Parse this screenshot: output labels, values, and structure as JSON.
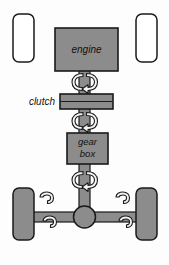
{
  "diagram": {
    "type": "mechanical-schematic",
    "background_color": "#fdfdfd",
    "palette": {
      "component_fill": "#8c8c8c",
      "shaft_fill": "#8c8c8c",
      "outline": "#1a1a1a",
      "wheel_front_fill": "#ffffff",
      "wheel_rear_fill": "#8c8c8c",
      "rotation_symbol_fill": "#f2f2f2",
      "text_color": "#111111"
    },
    "components": {
      "engine": {
        "label": "engine",
        "shape": "rectangle",
        "fill": "#8c8c8c",
        "x": 55,
        "y": 28,
        "width": 63,
        "height": 43
      },
      "clutch": {
        "label": "clutch",
        "label_position": "left-outside",
        "shape": "rectangle",
        "fill": "#8c8c8c",
        "x": 60,
        "y": 94,
        "width": 53,
        "height": 15
      },
      "gearbox": {
        "label_line1": "gear",
        "label_line2": "box",
        "shape": "rectangle",
        "fill": "#8c8c8c",
        "x": 67,
        "y": 133,
        "width": 41,
        "height": 31
      },
      "differential": {
        "label": "",
        "shape": "circle",
        "fill": "#8c8c8c",
        "cx": 84.5,
        "cy": 217,
        "r": 11
      },
      "driveshaft": {
        "label": "",
        "shape": "vertical-shaft",
        "fill": "#8c8c8c",
        "x": 79,
        "y": 68,
        "width": 11,
        "height": 150
      },
      "rear_axle": {
        "label": "",
        "shape": "horizontal-shaft",
        "fill": "#8c8c8c",
        "x": 24,
        "y": 212,
        "width": 121,
        "height": 10
      }
    },
    "wheels": [
      {
        "name": "front-left",
        "fill": "#ffffff",
        "x": 13,
        "y": 14,
        "width": 21,
        "height": 48
      },
      {
        "name": "front-right",
        "fill": "#ffffff",
        "x": 136,
        "y": 14,
        "width": 21,
        "height": 48
      },
      {
        "name": "rear-left",
        "fill": "#8c8c8c",
        "x": 13,
        "y": 188,
        "width": 21,
        "height": 52
      },
      {
        "name": "rear-right",
        "fill": "#8c8c8c",
        "x": 136,
        "y": 188,
        "width": 21,
        "height": 52
      }
    ],
    "rotation_symbols": [
      {
        "name": "rotation-engine-to-clutch",
        "axis": "vertical",
        "cx": 84.5,
        "cy": 82
      },
      {
        "name": "rotation-clutch-to-gearbox",
        "axis": "vertical",
        "cx": 84.5,
        "cy": 121
      },
      {
        "name": "rotation-gearbox-to-diff",
        "axis": "vertical",
        "cx": 84.5,
        "cy": 180
      },
      {
        "name": "rotation-axle-left-upper",
        "axis": "horizontal",
        "cx": 47,
        "cy": 206
      },
      {
        "name": "rotation-axle-left-lower",
        "axis": "horizontal",
        "cx": 50,
        "cy": 229
      },
      {
        "name": "rotation-axle-right-upper",
        "axis": "horizontal",
        "cx": 123,
        "cy": 206
      },
      {
        "name": "rotation-axle-right-lower",
        "axis": "horizontal",
        "cx": 126,
        "cy": 229
      }
    ]
  }
}
